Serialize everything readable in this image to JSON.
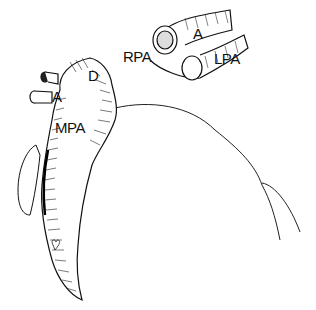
{
  "figure": {
    "type": "anatomical line drawing",
    "colors": {
      "ink": "#111111",
      "background": "#ffffff"
    }
  },
  "labels": {
    "main_view": {
      "d": "D",
      "a": "A",
      "mpa": "MPA"
    },
    "inset_view": {
      "rpa": "RPA",
      "a": "A",
      "lpa": "LPA"
    }
  }
}
